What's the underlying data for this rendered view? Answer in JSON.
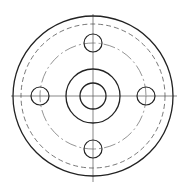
{
  "drawing": {
    "type": "flange-top-view",
    "center": [
      93,
      96
    ],
    "stroke_color": "#222222",
    "center_line_color": "#444444",
    "outer_radius": 80,
    "dashed_circle_radius": 72,
    "bolt_circle_radius": 53,
    "hub_outer_radius": 27,
    "bore_radius": 13,
    "bolt_hole_radius": 9,
    "bolt_hole_count": 4
  }
}
